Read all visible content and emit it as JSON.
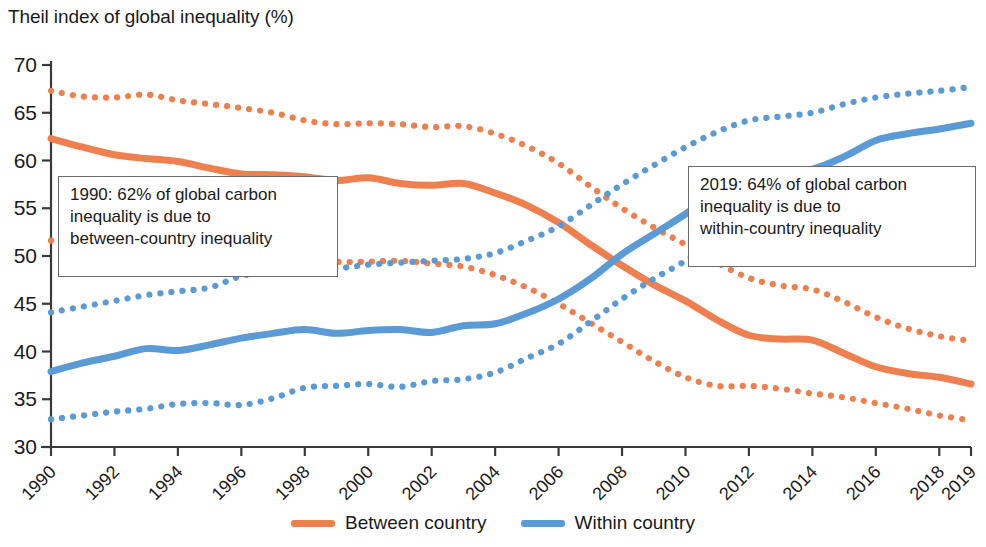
{
  "chart_data": {
    "type": "line",
    "title": "Theil index of global inequality (%)",
    "xlabel": "",
    "ylabel": "Theil index of global inequality (%)",
    "xlim": [
      1990,
      2019
    ],
    "ylim": [
      30,
      70
    ],
    "ytick_labels": [
      "70",
      "65",
      "60",
      "55",
      "50",
      "45",
      "40",
      "35",
      "30"
    ],
    "ytick_values": [
      70,
      65,
      60,
      55,
      50,
      45,
      40,
      35,
      30
    ],
    "xtick_labels": [
      "1990",
      "1992",
      "1994",
      "1996",
      "1998",
      "2000",
      "2002",
      "2004",
      "2006",
      "2008",
      "2010",
      "2012",
      "2014",
      "2016",
      "2018",
      "2019"
    ],
    "xtick_values": [
      1990,
      1992,
      1994,
      1996,
      1998,
      2000,
      2002,
      2004,
      2006,
      2008,
      2010,
      2012,
      2014,
      2016,
      2018,
      2019
    ],
    "grid": false,
    "legend_position": "bottom",
    "x": [
      1990,
      1991,
      1992,
      1993,
      1994,
      1995,
      1996,
      1997,
      1998,
      1999,
      2000,
      2001,
      2002,
      2003,
      2004,
      2005,
      2006,
      2007,
      2008,
      2009,
      2010,
      2011,
      2012,
      2013,
      2014,
      2015,
      2016,
      2017,
      2018,
      2019
    ],
    "series": [
      {
        "name": "Between country",
        "style": "solid",
        "color": "#ee7f4e",
        "values": [
          62.3,
          61.4,
          60.6,
          60.2,
          59.9,
          59.2,
          58.6,
          58.5,
          58.3,
          57.9,
          58.2,
          57.6,
          57.4,
          57.6,
          56.6,
          55.3,
          53.5,
          51.2,
          49.0,
          47.0,
          45.3,
          43.3,
          41.7,
          41.3,
          41.2,
          39.8,
          38.4,
          37.7,
          37.3,
          36.6
        ]
      },
      {
        "name": "Between country upper bound",
        "style": "dotted",
        "color": "#ee7f4e",
        "values": [
          67.3,
          66.7,
          66.6,
          66.9,
          66.3,
          65.9,
          65.5,
          65.0,
          64.2,
          63.8,
          63.9,
          63.8,
          63.5,
          63.6,
          62.8,
          61.5,
          59.7,
          57.3,
          55.0,
          53.0,
          51.2,
          49.3,
          47.7,
          46.9,
          46.5,
          45.2,
          43.6,
          42.4,
          41.6,
          41.1
        ]
      },
      {
        "name": "Between country lower bound",
        "style": "dotted",
        "color": "#ee7f4e",
        "values": [
          51.6,
          51.7,
          51.3,
          51.2,
          51.0,
          50.7,
          50.4,
          50.1,
          49.7,
          49.4,
          49.4,
          49.5,
          49.2,
          48.9,
          48.0,
          46.7,
          45.0,
          43.0,
          41.0,
          39.0,
          37.3,
          36.4,
          36.4,
          36.1,
          35.6,
          35.2,
          34.6,
          34.0,
          33.3,
          32.8
        ]
      },
      {
        "name": "Within country",
        "style": "solid",
        "color": "#5a9bd5",
        "values": [
          37.9,
          38.8,
          39.5,
          40.3,
          40.1,
          40.7,
          41.4,
          41.9,
          42.3,
          41.9,
          42.2,
          42.3,
          42.0,
          42.7,
          42.9,
          44.0,
          45.5,
          47.6,
          50.2,
          52.3,
          54.4,
          56.8,
          58.4,
          58.8,
          59.1,
          60.4,
          62.1,
          62.8,
          63.3,
          63.9
        ]
      },
      {
        "name": "Within country upper bound",
        "style": "dotted",
        "color": "#5a9bd5",
        "values": [
          44.1,
          44.7,
          45.3,
          45.9,
          46.3,
          46.7,
          47.9,
          48.4,
          48.7,
          48.7,
          49.1,
          49.3,
          49.5,
          49.7,
          50.3,
          51.6,
          53.1,
          55.3,
          57.5,
          59.5,
          61.4,
          63.0,
          64.2,
          64.6,
          65.0,
          65.9,
          66.6,
          67.0,
          67.3,
          67.7
        ]
      },
      {
        "name": "Within country lower bound",
        "style": "dotted",
        "color": "#5a9bd5",
        "values": [
          32.9,
          33.3,
          33.7,
          34.0,
          34.5,
          34.6,
          34.4,
          35.1,
          36.2,
          36.4,
          36.6,
          36.3,
          36.9,
          37.1,
          37.8,
          39.3,
          40.8,
          43.1,
          45.5,
          47.6,
          49.5,
          51.7,
          53.5,
          54.0,
          54.4,
          55.6,
          57.0,
          57.9,
          58.5,
          59.1
        ]
      }
    ],
    "annotations": [
      {
        "id": "left",
        "text": "1990: 62% of global carbon\ninequality is due to\nbetween-country inequality"
      },
      {
        "id": "right",
        "text": "2019: 64% of global carbon\ninequality is due to\nwithin-country inequality"
      }
    ],
    "legend": [
      {
        "label": "Between country",
        "color": "#ee7f4e"
      },
      {
        "label": "Within country",
        "color": "#5a9bd5"
      }
    ]
  }
}
